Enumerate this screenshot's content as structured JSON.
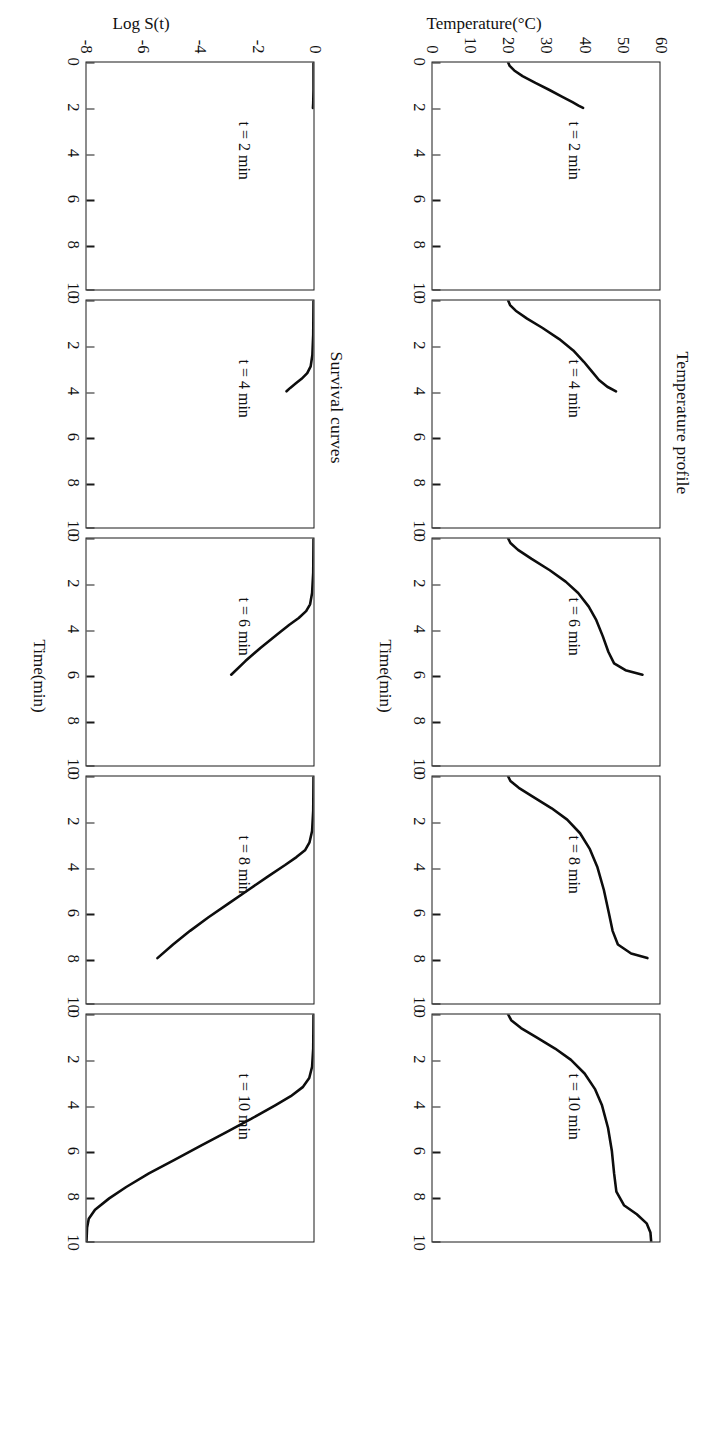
{
  "figure": {
    "orientation_note": "rotated-180",
    "line_color": "#0d0d0d",
    "axis_color": "#1a1a1a",
    "background": "#ffffff"
  },
  "rows": [
    {
      "key": "temperature",
      "title": "Temperature profile",
      "ylabel": "Temperature(°C)",
      "xlabel": "Time(min)"
    },
    {
      "key": "survival",
      "title": "Survival curves",
      "ylabel": "Log S(t)",
      "xlabel": "Time(min)"
    }
  ],
  "panel_labels": {
    "t2": "t = 2 min",
    "t4": "t = 4 min",
    "t6": "t = 6 min",
    "t8": "t = 8 min",
    "t10": "t = 10 min"
  },
  "axes": {
    "x_ticks": [
      "0",
      "2",
      "4",
      "6",
      "8",
      "10"
    ],
    "temperature_y_ticks": [
      "60",
      "50",
      "40",
      "30",
      "20",
      "10",
      "0"
    ],
    "survival_y_ticks": [
      "0",
      "-2",
      "-4",
      "-6",
      "-8"
    ]
  },
  "chart_data": [
    {
      "type": "line",
      "title": "Temperature profile",
      "xlabel": "Time(min)",
      "ylabel": "Temperature(°C)",
      "xlim": [
        0,
        10
      ],
      "ylim": [
        0,
        60
      ],
      "grid": false,
      "legend": "none",
      "panels": [
        {
          "label": "t = 2 min",
          "x": [
            0.0,
            0.15,
            0.35,
            0.6,
            0.9,
            1.2,
            1.5,
            1.75,
            1.9,
            2.0
          ],
          "y": [
            20.0,
            20.4,
            21.6,
            23.8,
            27.2,
            30.8,
            34.2,
            37.0,
            38.6,
            39.8
          ]
        },
        {
          "label": "t = 4 min",
          "x": [
            0.0,
            0.2,
            0.45,
            0.8,
            1.2,
            1.7,
            2.2,
            2.7,
            3.1,
            3.5,
            3.8,
            4.0
          ],
          "y": [
            20.0,
            20.5,
            22.0,
            25.0,
            29.0,
            33.5,
            37.2,
            40.0,
            42.0,
            44.0,
            46.2,
            48.5
          ]
        },
        {
          "label": "t = 6 min",
          "x": [
            0.0,
            0.2,
            0.5,
            0.9,
            1.4,
            1.9,
            2.4,
            3.0,
            3.6,
            4.3,
            5.0,
            5.5,
            5.8,
            6.0
          ],
          "y": [
            20.0,
            20.6,
            22.6,
            26.2,
            31.0,
            35.2,
            38.5,
            41.3,
            43.3,
            45.0,
            46.5,
            48.0,
            51.0,
            55.5
          ]
        },
        {
          "label": "t = 8 min",
          "x": [
            0.0,
            0.2,
            0.5,
            0.9,
            1.4,
            1.9,
            2.5,
            3.2,
            4.0,
            5.0,
            6.0,
            6.8,
            7.4,
            7.8,
            8.0
          ],
          "y": [
            20.0,
            20.6,
            22.8,
            26.6,
            31.5,
            35.6,
            39.0,
            41.6,
            43.6,
            45.3,
            46.6,
            47.6,
            49.0,
            52.5,
            56.8
          ]
        },
        {
          "label": "t = 10 min",
          "x": [
            0.0,
            0.25,
            0.6,
            1.0,
            1.5,
            2.0,
            2.6,
            3.3,
            4.0,
            5.0,
            6.0,
            7.0,
            7.8,
            8.4,
            8.8,
            9.2,
            9.6,
            10.0
          ],
          "y": [
            20.0,
            20.8,
            23.4,
            27.4,
            32.4,
            36.6,
            40.2,
            43.0,
            44.8,
            46.4,
            47.4,
            48.0,
            48.6,
            50.6,
            54.0,
            56.6,
            57.6,
            57.8
          ]
        }
      ]
    },
    {
      "type": "line",
      "title": "Survival curves",
      "xlabel": "Time(min)",
      "ylabel": "Log S(t)",
      "xlim": [
        0,
        10
      ],
      "ylim": [
        -8,
        0
      ],
      "grid": false,
      "legend": "none",
      "panels": [
        {
          "label": "t = 2 min",
          "x": [
            0.0,
            1.2,
            1.8,
            2.0
          ],
          "y": [
            0.0,
            0.0,
            -0.01,
            -0.02
          ]
        },
        {
          "label": "t = 4 min",
          "x": [
            0.0,
            1.5,
            2.4,
            2.9,
            3.2,
            3.45,
            3.65,
            3.85,
            4.0
          ],
          "y": [
            0.0,
            -0.01,
            -0.04,
            -0.1,
            -0.22,
            -0.42,
            -0.62,
            -0.82,
            -0.95
          ]
        },
        {
          "label": "t = 6 min",
          "x": [
            0.0,
            1.5,
            2.4,
            2.9,
            3.2,
            3.5,
            3.8,
            4.2,
            4.8,
            5.4,
            6.0
          ],
          "y": [
            0.0,
            -0.01,
            -0.05,
            -0.12,
            -0.26,
            -0.52,
            -0.85,
            -1.25,
            -1.85,
            -2.4,
            -2.9
          ]
        },
        {
          "label": "t = 8 min",
          "x": [
            0.0,
            1.5,
            2.4,
            2.9,
            3.25,
            3.55,
            3.9,
            4.4,
            5.0,
            5.6,
            6.2,
            6.8,
            7.4,
            8.0
          ],
          "y": [
            0.0,
            -0.01,
            -0.05,
            -0.14,
            -0.3,
            -0.6,
            -1.0,
            -1.6,
            -2.3,
            -3.0,
            -3.7,
            -4.35,
            -4.95,
            -5.5
          ]
        },
        {
          "label": "t = 10 min",
          "x": [
            0.0,
            1.5,
            2.3,
            2.8,
            3.2,
            3.6,
            4.0,
            4.6,
            5.2,
            5.8,
            6.4,
            7.0,
            7.6,
            8.1,
            8.6,
            9.0,
            9.4,
            10.0
          ],
          "y": [
            0.0,
            -0.01,
            -0.05,
            -0.15,
            -0.38,
            -0.8,
            -1.35,
            -2.2,
            -3.1,
            -4.0,
            -4.9,
            -5.8,
            -6.6,
            -7.2,
            -7.7,
            -7.92,
            -7.98,
            -8.0
          ]
        }
      ]
    }
  ]
}
